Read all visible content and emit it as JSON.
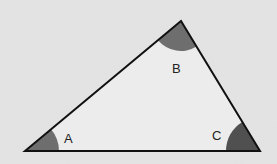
{
  "diagram": {
    "type": "triangle",
    "vertices": {
      "A": [
        25,
        151
      ],
      "B": [
        181,
        21
      ],
      "C": [
        260,
        151
      ]
    },
    "angle_labels": [
      {
        "name": "A",
        "text": "A",
        "x": 64,
        "y": 143
      },
      {
        "name": "B",
        "text": "B",
        "x": 172,
        "y": 73
      },
      {
        "name": "C",
        "text": "C",
        "x": 212,
        "y": 140
      }
    ],
    "colors": {
      "background": "#e4e4e4",
      "fill": "#ececec",
      "stroke": "#111111",
      "arc_A": "#6e6e6e",
      "arc_B": "#6e6e6e",
      "arc_C": "#505050"
    }
  }
}
